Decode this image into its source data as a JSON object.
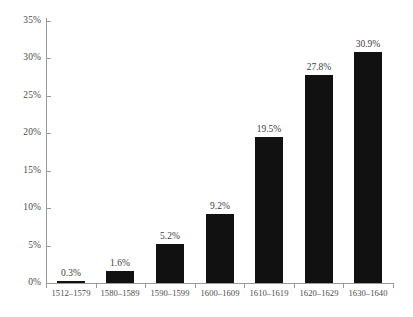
{
  "chart_data": {
    "type": "bar",
    "title": "",
    "subtitle": "",
    "xlabel": "",
    "ylabel": "",
    "categories": [
      "1512–1579",
      "1580–1589",
      "1590–1599",
      "1600–1609",
      "1610–1619",
      "1620–1629",
      "1630–1640"
    ],
    "values": [
      0.3,
      1.6,
      5.2,
      9.2,
      19.5,
      27.8,
      30.9
    ],
    "value_labels": [
      "0.3%",
      "1.6%",
      "5.2%",
      "9.2%",
      "19.5%",
      "27.8%",
      "30.9%"
    ],
    "ylim": [
      0,
      35
    ],
    "ytick_values": [
      0,
      5,
      10,
      15,
      20,
      25,
      30,
      35
    ],
    "ytick_labels": [
      "0%",
      "5%",
      "10%",
      "15%",
      "20%",
      "25%",
      "30%",
      "35%"
    ],
    "grid": false,
    "legend": null,
    "legend_position": "none",
    "bar_color": "#111111",
    "axis_color": "#9a9a9a",
    "text_color": "#4a4a4a",
    "background_color": "#ffffff"
  }
}
